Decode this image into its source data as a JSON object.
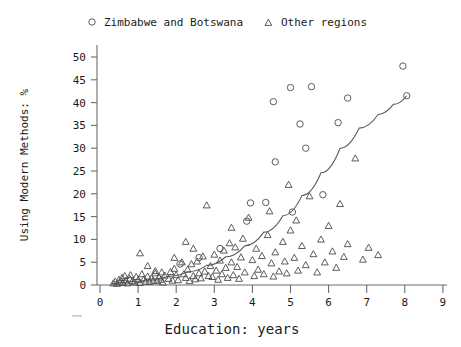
{
  "chart_data": {
    "type": "scatter",
    "title": "",
    "xlabel": "Education: years",
    "ylabel": "Using Modern Methods: %",
    "xlim": [
      0,
      9
    ],
    "ylim": [
      0,
      52
    ],
    "xticks": [
      0,
      1,
      2,
      3,
      4,
      5,
      6,
      7,
      8,
      9
    ],
    "yticks": [
      0,
      5,
      10,
      15,
      20,
      25,
      30,
      35,
      40,
      45,
      50
    ],
    "grid": false,
    "legend_position": "top",
    "series": [
      {
        "name": "Zimbabwe and Botswana",
        "marker": "circle",
        "points": [
          [
            4.55,
            40.2
          ],
          [
            4.6,
            27.0
          ],
          [
            5.0,
            43.3
          ],
          [
            5.25,
            35.3
          ],
          [
            5.4,
            30.0
          ],
          [
            5.55,
            43.5
          ],
          [
            5.85,
            19.8
          ],
          [
            6.25,
            35.6
          ],
          [
            6.5,
            41.0
          ],
          [
            7.95,
            48.0
          ],
          [
            8.05,
            41.5
          ],
          [
            3.85,
            14.0
          ],
          [
            3.95,
            18.0
          ],
          [
            4.35,
            18.1
          ],
          [
            5.05,
            16.0
          ],
          [
            2.6,
            6.0
          ],
          [
            2.1,
            4.6
          ],
          [
            3.15,
            8.0
          ]
        ]
      },
      {
        "name": "Other regions",
        "marker": "triangle",
        "points": [
          [
            0.35,
            0.4
          ],
          [
            0.4,
            0.8
          ],
          [
            0.45,
            0.3
          ],
          [
            0.5,
            1.2
          ],
          [
            0.52,
            0.6
          ],
          [
            0.58,
            1.6
          ],
          [
            0.6,
            0.5
          ],
          [
            0.65,
            2.0
          ],
          [
            0.68,
            1.0
          ],
          [
            0.72,
            0.4
          ],
          [
            0.78,
            1.4
          ],
          [
            0.8,
            2.2
          ],
          [
            0.85,
            0.9
          ],
          [
            0.9,
            0.6
          ],
          [
            0.95,
            1.8
          ],
          [
            1.0,
            1.1
          ],
          [
            1.05,
            0.5
          ],
          [
            1.1,
            2.4
          ],
          [
            1.15,
            1.3
          ],
          [
            1.2,
            0.8
          ],
          [
            1.25,
            1.9
          ],
          [
            1.3,
            0.7
          ],
          [
            1.35,
            1.5
          ],
          [
            1.4,
            1.0
          ],
          [
            1.45,
            2.6
          ],
          [
            1.5,
            0.9
          ],
          [
            1.55,
            1.7
          ],
          [
            1.6,
            1.2
          ],
          [
            1.65,
            0.6
          ],
          [
            1.7,
            2.1
          ],
          [
            1.05,
            7.0
          ],
          [
            1.25,
            4.2
          ],
          [
            1.45,
            3.1
          ],
          [
            1.62,
            2.8
          ],
          [
            1.8,
            1.4
          ],
          [
            1.85,
            2.9
          ],
          [
            1.9,
            1.0
          ],
          [
            1.95,
            3.6
          ],
          [
            2.0,
            2.2
          ],
          [
            2.05,
            1.1
          ],
          [
            2.15,
            5.0
          ],
          [
            2.2,
            2.4
          ],
          [
            2.25,
            1.6
          ],
          [
            2.3,
            3.4
          ],
          [
            2.35,
            0.9
          ],
          [
            2.4,
            4.6
          ],
          [
            2.45,
            2.0
          ],
          [
            2.5,
            1.3
          ],
          [
            2.55,
            5.2
          ],
          [
            2.6,
            2.6
          ],
          [
            2.65,
            1.5
          ],
          [
            2.7,
            6.3
          ],
          [
            2.75,
            3.0
          ],
          [
            2.8,
            17.5
          ],
          [
            2.85,
            2.0
          ],
          [
            2.9,
            4.2
          ],
          [
            2.95,
            1.8
          ],
          [
            3.0,
            6.7
          ],
          [
            3.05,
            3.2
          ],
          [
            3.1,
            1.2
          ],
          [
            3.15,
            5.4
          ],
          [
            3.2,
            2.4
          ],
          [
            3.25,
            7.6
          ],
          [
            3.3,
            3.8
          ],
          [
            3.35,
            1.6
          ],
          [
            3.4,
            9.2
          ],
          [
            3.45,
            5.0
          ],
          [
            3.5,
            2.2
          ],
          [
            3.55,
            8.3
          ],
          [
            3.6,
            4.0
          ],
          [
            3.65,
            1.4
          ],
          [
            3.7,
            6.1
          ],
          [
            3.75,
            10.2
          ],
          [
            3.8,
            2.8
          ],
          [
            3.9,
            14.8
          ],
          [
            4.0,
            5.5
          ],
          [
            4.05,
            2.0
          ],
          [
            4.1,
            8.0
          ],
          [
            4.15,
            3.4
          ],
          [
            4.25,
            6.4
          ],
          [
            4.3,
            2.4
          ],
          [
            4.4,
            11.0
          ],
          [
            4.5,
            4.8
          ],
          [
            4.55,
            1.9
          ],
          [
            4.6,
            7.2
          ],
          [
            4.7,
            3.0
          ],
          [
            4.8,
            9.5
          ],
          [
            4.85,
            5.2
          ],
          [
            4.9,
            2.6
          ],
          [
            5.0,
            12.0
          ],
          [
            5.1,
            6.0
          ],
          [
            5.2,
            3.2
          ],
          [
            5.3,
            8.6
          ],
          [
            5.4,
            4.4
          ],
          [
            5.5,
            19.5
          ],
          [
            5.6,
            6.8
          ],
          [
            5.7,
            2.8
          ],
          [
            5.8,
            10.0
          ],
          [
            5.9,
            5.0
          ],
          [
            6.0,
            13.0
          ],
          [
            6.1,
            7.4
          ],
          [
            6.2,
            3.8
          ],
          [
            6.3,
            17.8
          ],
          [
            6.4,
            6.2
          ],
          [
            6.5,
            9.0
          ],
          [
            6.7,
            27.8
          ],
          [
            6.9,
            5.6
          ],
          [
            7.05,
            8.2
          ],
          [
            7.3,
            6.6
          ],
          [
            4.95,
            22.0
          ],
          [
            5.15,
            14.2
          ],
          [
            4.45,
            16.2
          ],
          [
            2.25,
            9.5
          ],
          [
            1.95,
            6.0
          ],
          [
            2.45,
            8.0
          ],
          [
            3.45,
            12.6
          ]
        ]
      }
    ],
    "fit_curve": {
      "label": "fitted curve",
      "points": [
        [
          0.3,
          0.3
        ],
        [
          0.8,
          0.7
        ],
        [
          1.3,
          1.2
        ],
        [
          1.8,
          1.9
        ],
        [
          2.3,
          2.9
        ],
        [
          2.8,
          4.3
        ],
        [
          3.3,
          6.2
        ],
        [
          3.8,
          8.6
        ],
        [
          4.3,
          11.6
        ],
        [
          4.8,
          15.2
        ],
        [
          5.3,
          19.6
        ],
        [
          5.8,
          24.6
        ],
        [
          6.3,
          30.0
        ],
        [
          6.8,
          34.4
        ],
        [
          7.3,
          37.4
        ],
        [
          7.7,
          39.6
        ],
        [
          8.05,
          41.5
        ]
      ]
    }
  },
  "legend": {
    "items": [
      {
        "label": "Zimbabwe and Botswana",
        "marker": "circle"
      },
      {
        "label": "Other regions",
        "marker": "triangle"
      }
    ]
  },
  "axes": {
    "x_title": "Education: years",
    "y_title": "Using Modern Methods: %",
    "x_tick_labels": [
      "0",
      "1",
      "2",
      "3",
      "4",
      "5",
      "6",
      "7",
      "8",
      "9"
    ],
    "y_tick_labels": [
      "0",
      "5",
      "10",
      "15",
      "20",
      "25",
      "30",
      "35",
      "40",
      "45",
      "50"
    ]
  },
  "colors": {
    "marker": "#4a4a4a",
    "curve": "#5a5a5a",
    "axis": "#6d6d6d",
    "text": "#1a1a1a",
    "background": "#ffffff"
  }
}
